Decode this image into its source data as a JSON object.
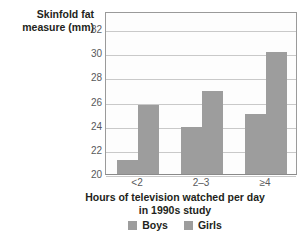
{
  "chart_data": {
    "type": "bar",
    "title": "",
    "subtitle": "",
    "categories": [
      "<2",
      "2–3",
      "≥4"
    ],
    "series": [
      {
        "name": "Boys",
        "values": [
          21.2,
          23.9,
          25.0
        ],
        "color": "#9d9d9d"
      },
      {
        "name": "Girls",
        "values": [
          25.7,
          26.9,
          30.1
        ],
        "color": "#9d9d9d"
      }
    ],
    "ylabel_lines": [
      "Skinfold fat",
      "measure (mm)"
    ],
    "ylabel": "Skinfold fat measure (mm)",
    "xlabel_lines": [
      "Hours of television watched per day",
      "in 1990s study"
    ],
    "xlabel": "Hours of television watched per day in 1990s study",
    "ylim": [
      20,
      33.5
    ],
    "yticks": [
      20,
      22,
      24,
      26,
      28,
      30,
      32
    ],
    "ytick_labels": [
      "20",
      "22",
      "24",
      "26",
      "28",
      "30",
      "32"
    ],
    "grid": true,
    "grid_axis": "y",
    "legend_position": "bottom",
    "legend_entries": [
      "Boys",
      "Girls"
    ],
    "bar_color": "#9d9d9d",
    "grid_color": "#c9c9c9",
    "axis_color": "#9a9a9a",
    "plot_background": "#fdfdfd",
    "page_background": "#ffffff"
  }
}
